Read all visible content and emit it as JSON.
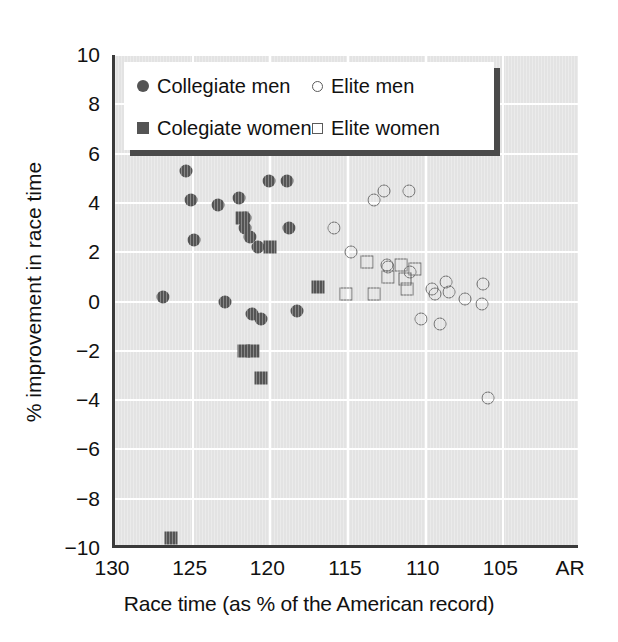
{
  "chart_data": {
    "type": "scatter",
    "title": "",
    "xlabel": "Race time (as % of the American record)",
    "ylabel": "% improvement in race time",
    "xlim": [
      130,
      100
    ],
    "ylim": [
      -10,
      10
    ],
    "x_reversed": true,
    "xticks": [
      130,
      125,
      120,
      115,
      110,
      105
    ],
    "xticklabels": [
      "130",
      "125",
      "120",
      "115",
      "110",
      "105",
      "AR"
    ],
    "yticks": [
      10,
      8,
      6,
      4,
      2,
      0,
      -2,
      -4,
      -6,
      -8,
      -10
    ],
    "yticklabels": [
      "10",
      "8",
      "6",
      "4",
      "2",
      "0",
      "−2",
      "−4",
      "−6",
      "−8",
      "−10"
    ],
    "grid": true,
    "grid_color": "#ffffff",
    "plot_background": "#e3e3e3",
    "marker_fill_color": "#545454",
    "marker_open_color": "#6a6a6a",
    "legend_position": "upper-left-inside",
    "series": [
      {
        "name": "Collegiate men",
        "marker": "circle-filled",
        "points": [
          [
            126.9,
            0.2
          ],
          [
            125.4,
            5.3
          ],
          [
            125.1,
            4.1
          ],
          [
            124.9,
            2.5
          ],
          [
            123.4,
            3.9
          ],
          [
            122.9,
            0.0
          ],
          [
            122.0,
            4.2
          ],
          [
            121.6,
            3.4
          ],
          [
            121.6,
            3.0
          ],
          [
            121.3,
            2.6
          ],
          [
            121.2,
            -0.5
          ],
          [
            120.8,
            2.2
          ],
          [
            120.6,
            -0.7
          ],
          [
            120.1,
            4.9
          ],
          [
            118.9,
            4.9
          ],
          [
            118.8,
            3.0
          ],
          [
            118.3,
            -0.4
          ]
        ]
      },
      {
        "name": "Colegiate women",
        "marker": "square-filled",
        "points": [
          [
            126.4,
            -9.6
          ],
          [
            121.8,
            3.4
          ],
          [
            121.7,
            -2.0
          ],
          [
            121.1,
            -2.0
          ],
          [
            120.6,
            -3.1
          ],
          [
            120.0,
            2.2
          ],
          [
            116.9,
            0.6
          ]
        ]
      },
      {
        "name": "Elite men",
        "marker": "circle-open",
        "points": [
          [
            115.9,
            3.0
          ],
          [
            114.8,
            2.0
          ],
          [
            113.3,
            4.1
          ],
          [
            112.7,
            4.5
          ],
          [
            112.5,
            1.5
          ],
          [
            112.4,
            1.4
          ],
          [
            111.1,
            4.5
          ],
          [
            111.0,
            1.2
          ],
          [
            110.3,
            -0.7
          ],
          [
            109.6,
            0.5
          ],
          [
            109.4,
            0.3
          ],
          [
            109.1,
            -0.9
          ],
          [
            108.7,
            0.8
          ],
          [
            108.5,
            0.4
          ],
          [
            107.5,
            0.1
          ],
          [
            106.4,
            -0.1
          ],
          [
            106.3,
            0.7
          ],
          [
            106.0,
            -3.9
          ]
        ]
      },
      {
        "name": "Elite women",
        "marker": "square-open",
        "points": [
          [
            115.1,
            0.3
          ],
          [
            113.8,
            1.6
          ],
          [
            113.3,
            0.3
          ],
          [
            112.4,
            1.0
          ],
          [
            111.6,
            1.5
          ],
          [
            111.3,
            0.9
          ],
          [
            111.2,
            0.5
          ],
          [
            110.7,
            1.3
          ]
        ]
      }
    ]
  },
  "axes": {
    "x_title": "Race time (as % of the American record)",
    "y_title": "% improvement in race time"
  },
  "legend": {
    "entries": [
      {
        "label": "Collegiate men",
        "marker": "circle-filled"
      },
      {
        "label": "Elite men",
        "marker": "circle-open"
      },
      {
        "label": "Colegiate women",
        "marker": "square-filled"
      },
      {
        "label": "Elite women",
        "marker": "square-open"
      }
    ]
  }
}
